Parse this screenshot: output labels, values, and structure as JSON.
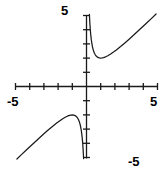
{
  "figure": {
    "kind": "cartesian-graph",
    "width": 168,
    "height": 174,
    "background": "#ffffff",
    "stroke_color": "#1a1a1a",
    "labels": {
      "y_max": "5",
      "y_min": "-5",
      "x_min": "-5",
      "x_max": "5"
    }
  },
  "chart_data": {
    "type": "line",
    "title": "",
    "xlabel": "",
    "ylabel": "",
    "xlim": [
      -5,
      5
    ],
    "ylim": [
      -5,
      5
    ],
    "grid": false,
    "legend": "none",
    "x_tick_labels": [
      "-5",
      "5"
    ],
    "y_tick_labels": [
      "5",
      "-5"
    ],
    "x_ticks": [
      -5,
      -4,
      -3,
      -2,
      -1,
      1,
      2,
      3,
      4,
      5
    ],
    "y_ticks": [
      -5,
      -4,
      -3,
      -2,
      -1,
      1,
      2,
      3,
      4,
      5
    ],
    "axes": {
      "x_axis_at_y": 0,
      "y_axis_at_x": 0,
      "tick_length_px": 7
    },
    "annotations": [
      "vertical asymptote at x = 0",
      "local minimum at (1, 2)",
      "local maximum at (-1, -2)"
    ],
    "series": [
      {
        "name": "y = x + 1/x (right branch)",
        "x": [
          0.205,
          0.22,
          0.24,
          0.26,
          0.28,
          0.3,
          0.34,
          0.38,
          0.42,
          0.46,
          0.5,
          0.56,
          0.62,
          0.7,
          0.8,
          0.9,
          1.0,
          1.1,
          1.2,
          1.35,
          1.5,
          1.7,
          1.9,
          2.1,
          2.4,
          2.7,
          3.0,
          3.4,
          3.8,
          4.2,
          4.6,
          4.9
        ],
        "y": [
          5.08,
          4.765,
          4.407,
          4.105,
          3.851,
          3.633,
          3.281,
          3.012,
          2.801,
          2.634,
          2.5,
          2.346,
          2.233,
          2.129,
          2.05,
          2.011,
          2.0,
          2.009,
          2.033,
          2.091,
          2.167,
          2.288,
          2.426,
          2.576,
          2.817,
          3.07,
          3.333,
          3.694,
          4.063,
          4.438,
          4.817,
          5.104
        ]
      },
      {
        "name": "y = x + 1/x (left branch)",
        "x": [
          -4.9,
          -4.6,
          -4.2,
          -3.8,
          -3.4,
          -3.0,
          -2.7,
          -2.4,
          -2.1,
          -1.9,
          -1.7,
          -1.5,
          -1.35,
          -1.2,
          -1.1,
          -1.0,
          -0.9,
          -0.8,
          -0.7,
          -0.62,
          -0.56,
          -0.5,
          -0.46,
          -0.42,
          -0.38,
          -0.34,
          -0.3,
          -0.28,
          -0.26,
          -0.24,
          -0.22,
          -0.205
        ],
        "y": [
          -5.104,
          -4.817,
          -4.438,
          -4.063,
          -3.694,
          -3.333,
          -3.07,
          -2.817,
          -2.576,
          -2.426,
          -2.288,
          -2.167,
          -2.091,
          -2.033,
          -2.009,
          -2.0,
          -2.011,
          -2.05,
          -2.129,
          -2.233,
          -2.346,
          -2.5,
          -2.634,
          -2.801,
          -3.012,
          -3.281,
          -3.633,
          -3.851,
          -4.105,
          -4.407,
          -4.765,
          -5.08
        ]
      }
    ]
  }
}
